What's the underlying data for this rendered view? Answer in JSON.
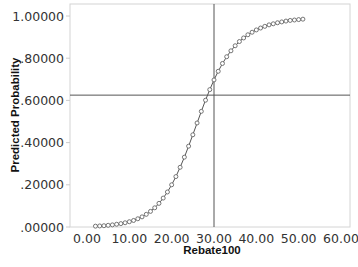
{
  "chart_data": {
    "type": "line",
    "title": "",
    "xlabel": "Rebate100",
    "ylabel": "Predicted Probability",
    "xlim": [
      0,
      60
    ],
    "ylim": [
      0,
      1
    ],
    "x_ticks": [
      "0.00",
      "10.00",
      "20.00",
      "30.00",
      "40.00",
      "50.00",
      "60.00"
    ],
    "y_ticks": [
      ".00000",
      ".20000",
      ".40000",
      ".60000",
      ".80000",
      "1.00000"
    ],
    "grid": false,
    "legend": null,
    "markers": "open-circle",
    "reference_lines": {
      "vertical_x": 30,
      "horizontal_y": 0.625
    },
    "series": [
      {
        "name": "Predicted Probability",
        "x": [
          2,
          3,
          4,
          5,
          6,
          7,
          8,
          9,
          10,
          11,
          12,
          13,
          14,
          15,
          16,
          17,
          18,
          19,
          20,
          21,
          22,
          23,
          24,
          25,
          26,
          27,
          28,
          29,
          30,
          31,
          32,
          33,
          34,
          35,
          36,
          37,
          38,
          39,
          40,
          41,
          42,
          43,
          44,
          45,
          46,
          47,
          48,
          49,
          50,
          51
        ],
        "values": [
          0.004,
          0.005,
          0.006,
          0.008,
          0.01,
          0.013,
          0.016,
          0.02,
          0.025,
          0.031,
          0.039,
          0.048,
          0.06,
          0.074,
          0.091,
          0.112,
          0.137,
          0.166,
          0.2,
          0.239,
          0.283,
          0.331,
          0.383,
          0.437,
          0.493,
          0.548,
          0.601,
          0.651,
          0.697,
          0.738,
          0.775,
          0.807,
          0.835,
          0.859,
          0.879,
          0.896,
          0.911,
          0.923,
          0.934,
          0.943,
          0.951,
          0.958,
          0.963,
          0.968,
          0.972,
          0.976,
          0.979,
          0.981,
          0.983,
          0.985
        ]
      }
    ]
  },
  "colors": {
    "line": "#555555",
    "marker": "#666666",
    "frame": "#d4d4d4",
    "reference": "#555555"
  }
}
